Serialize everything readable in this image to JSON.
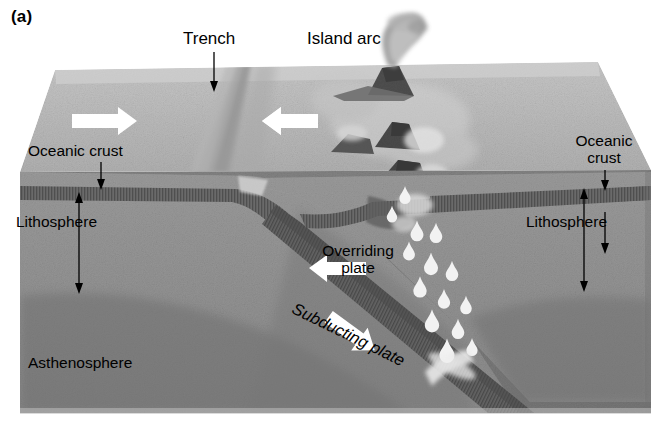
{
  "figure": {
    "panel_label": "(a)",
    "type": "geological cross-section block diagram"
  },
  "labels": {
    "trench": "Trench",
    "island_arc": "Island arc",
    "oceanic_crust_left": "Oceanic crust",
    "oceanic_crust_right": "Oceanic\ncrust",
    "lithosphere_left": "Lithosphere",
    "lithosphere_right": "Lithosphere",
    "asthenosphere": "Asthenosphere",
    "overriding_plate": "Overriding\nplate",
    "subducting_plate": "Subducting plate"
  },
  "colors": {
    "background": "#ffffff",
    "text": "#000000",
    "top_surface": "#b6b6b6",
    "top_surface_light": "#c9c9c9",
    "crust_band": "#6d6d6d",
    "lithosphere": "#909090",
    "asthenosphere": "#7c7c7c",
    "slab_crust": "#5f5f5f",
    "arrow_white": "#ffffff",
    "volcano_rock": "#4a4a4a",
    "magma_blob": "#ffffff",
    "plume": "#9a9a9a"
  },
  "motion_arrows": [
    {
      "name": "left-plate-convergence",
      "direction": "right",
      "surface": "top"
    },
    {
      "name": "right-plate-convergence",
      "direction": "left",
      "surface": "top"
    },
    {
      "name": "overriding-plate-motion",
      "direction": "left",
      "surface": "front"
    },
    {
      "name": "subducting-plate-motion",
      "direction": "down-right",
      "surface": "front"
    }
  ],
  "pointer_arrows": [
    {
      "name": "trench-pointer",
      "target": "trench",
      "direction": "down"
    },
    {
      "name": "oceanic-crust-left-pointer",
      "target": "oceanic crust (left)",
      "direction": "down"
    },
    {
      "name": "oceanic-crust-right-pointer",
      "target": "oceanic crust (right)",
      "direction": "down"
    },
    {
      "name": "lithosphere-left-extent",
      "target": "lithosphere thickness (left)",
      "direction": "double-headed vertical"
    },
    {
      "name": "lithosphere-right-extent",
      "target": "lithosphere thickness (right)",
      "direction": "double-headed vertical"
    }
  ],
  "features": {
    "magma_blob_count": 14,
    "volcano_count": 3,
    "slab_dip_degrees": 26
  }
}
